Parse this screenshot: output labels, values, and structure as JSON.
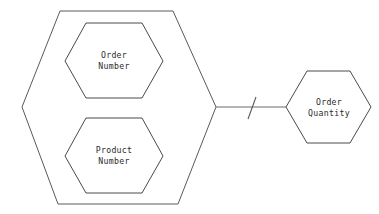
{
  "diagram": {
    "type": "entity-relationship-hexagon-diagram",
    "background_color": "#ffffff",
    "line_color": "#4a4a4a",
    "text_color": "#2b2b2b",
    "nodes": [
      {
        "id": "outer-group",
        "shape": "hexagon",
        "label": "",
        "role": "composite-attribute-group"
      },
      {
        "id": "order-number",
        "shape": "hexagon",
        "label_line1": "Order",
        "label_line2": "Number",
        "label": "Order\nNumber",
        "role": "attribute"
      },
      {
        "id": "product-number",
        "shape": "hexagon",
        "label_line1": "Product",
        "label_line2": "Number",
        "label": "Product\nNumber",
        "role": "attribute"
      },
      {
        "id": "order-quantity",
        "shape": "hexagon",
        "label_line1": "Order",
        "label_line2": "Quantity",
        "label": "Order\nQuantity",
        "role": "attribute"
      }
    ],
    "connector": {
      "from": "outer-group",
      "to": "order-quantity",
      "tick_mark": "\\",
      "style": "solid-with-slash-tick"
    }
  }
}
